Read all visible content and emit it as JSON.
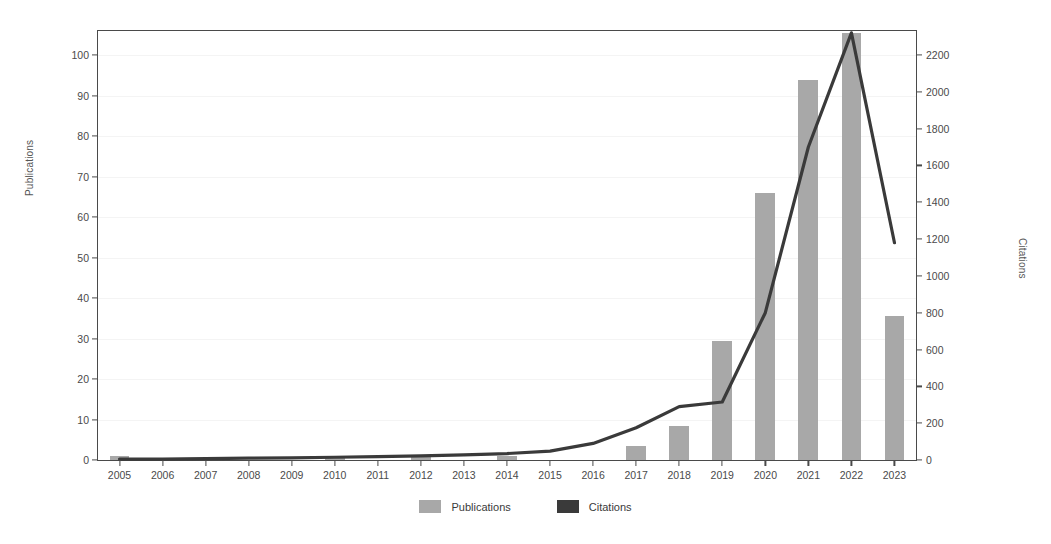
{
  "chart_data": {
    "type": "bar",
    "title": "",
    "xlabel": "",
    "ylabel": "Publications",
    "y2label": "Citations",
    "categories": [
      "2005",
      "2006",
      "2007",
      "2008",
      "2009",
      "2010",
      "2011",
      "2012",
      "2013",
      "2014",
      "2015",
      "2016",
      "2017",
      "2018",
      "2019",
      "2020",
      "2021",
      "2022",
      "2023"
    ],
    "ylim": [
      0,
      106
    ],
    "y2lim": [
      0,
      2330
    ],
    "yticks": [
      0,
      10,
      20,
      30,
      40,
      50,
      60,
      70,
      80,
      90,
      100
    ],
    "y2ticks": [
      0,
      200,
      400,
      600,
      800,
      1000,
      1200,
      1400,
      1600,
      1800,
      2000,
      2200
    ],
    "grid": false,
    "legend_position": "bottom",
    "series": [
      {
        "name": "Publications",
        "kind": "bar",
        "axis": "left",
        "color": "#a8a8a8",
        "values": [
          1,
          0,
          0,
          0,
          0,
          1,
          0,
          1,
          0,
          1,
          0,
          0,
          3.5,
          8.5,
          29.5,
          66,
          94,
          105.5,
          35.5
        ]
      },
      {
        "name": "Citations",
        "kind": "line",
        "axis": "right",
        "color": "#3a3a3a",
        "values": [
          5,
          5,
          8,
          10,
          12,
          15,
          18,
          22,
          28,
          35,
          48,
          90,
          175,
          290,
          315,
          800,
          1700,
          2320,
          1180
        ]
      }
    ]
  },
  "legend": {
    "items": [
      {
        "label": "Publications",
        "color": "#a8a8a8"
      },
      {
        "label": "Citations",
        "color": "#3a3a3a"
      }
    ]
  },
  "axes": {
    "left_title": "Publications",
    "right_title": "Citations"
  }
}
